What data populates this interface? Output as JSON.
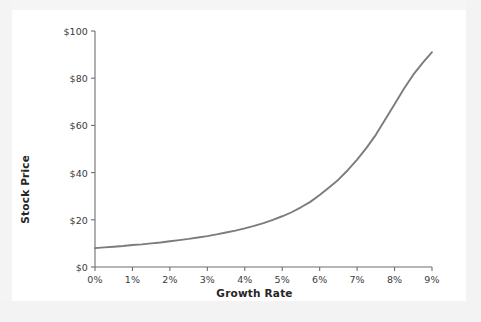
{
  "figure": {
    "background_color": "#f2f2f2",
    "card_color": "#ffffff",
    "line_color": "#7c7c7c",
    "axis_color": "#6e6e6e",
    "text_color": "#3b3b3b"
  },
  "chart_data": {
    "type": "line",
    "title": "",
    "xlabel": "Growth Rate",
    "ylabel": "Stock Price",
    "x_tick_labels": [
      "0%",
      "1%",
      "2%",
      "3%",
      "4%",
      "5%",
      "6%",
      "7%",
      "8%",
      "9%"
    ],
    "y_tick_labels": [
      "$0",
      "$20",
      "$40",
      "$60",
      "$80",
      "$100"
    ],
    "x": [
      0,
      1,
      2,
      3,
      4,
      5,
      6,
      7,
      8,
      9
    ],
    "y_ticks": [
      0,
      20,
      40,
      60,
      80,
      100
    ],
    "xlim": [
      0,
      9
    ],
    "ylim": [
      0,
      100
    ],
    "grid": false,
    "legend": null,
    "series": [
      {
        "name": "Stock Price vs Growth Rate",
        "color": "#7c7c7c",
        "x": [
          0.0,
          0.25,
          0.5,
          0.75,
          1.0,
          1.25,
          1.5,
          1.75,
          2.0,
          2.25,
          2.5,
          2.75,
          3.0,
          3.25,
          3.5,
          3.75,
          4.0,
          4.25,
          4.5,
          4.75,
          5.0,
          5.25,
          5.5,
          5.75,
          6.0,
          6.25,
          6.5,
          6.75,
          7.0,
          7.25,
          7.5,
          7.75,
          8.0,
          8.25,
          8.5,
          8.75,
          9.0
        ],
        "values": [
          8.0,
          8.3,
          8.6,
          8.9,
          9.3,
          9.6,
          10.0,
          10.4,
          10.9,
          11.4,
          11.9,
          12.5,
          13.1,
          13.8,
          14.6,
          15.4,
          16.4,
          17.4,
          18.6,
          20.0,
          21.5,
          23.2,
          25.3,
          27.6,
          30.5,
          33.7,
          37.0,
          41.0,
          45.5,
          50.5,
          56.0,
          62.5,
          69.0,
          75.5,
          81.5,
          86.5,
          91.0
        ]
      }
    ]
  }
}
